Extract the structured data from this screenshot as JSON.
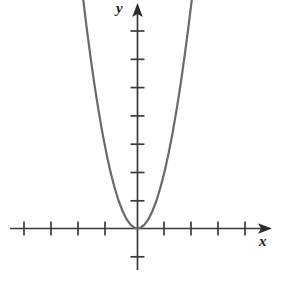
{
  "figure": {
    "width": 294,
    "height": 304,
    "background": "#ffffff"
  },
  "labels": {
    "x_axis": "x",
    "y_axis": "y"
  },
  "chart_data": {
    "type": "line",
    "title": "",
    "subtitle": "",
    "xlabel": "x",
    "ylabel": "y",
    "grid": false,
    "legend": null,
    "annotations": [],
    "axes": {
      "origin_px": [
        137.5,
        228.5
      ],
      "x_axis": {
        "start_px": 10,
        "end_px": 272,
        "arrow": "right",
        "tick_spacing_px": 27,
        "tick_positions_px": [
          24,
          51,
          78,
          105,
          137.5,
          164,
          191,
          218,
          245
        ],
        "tick_values": [
          -4,
          -3,
          -2,
          -1,
          0,
          1,
          2,
          3,
          4
        ],
        "tick_labels_shown": false,
        "range": [
          -4.7,
          5
        ]
      },
      "y_axis": {
        "start_px": 270,
        "end_px": 3,
        "arrow": "up",
        "tick_spacing_px": 28.3,
        "tick_positions_px": [
          31,
          59.3,
          87.6,
          115.9,
          144.2,
          172.5,
          200.8,
          228.5,
          256.8
        ],
        "tick_values": [
          7,
          6,
          5,
          4,
          3,
          2,
          1,
          0,
          -1
        ],
        "tick_labels_shown": false,
        "range": [
          -1,
          8
        ]
      }
    },
    "series": [
      {
        "name": "parabola",
        "equation": "y = 2x^2",
        "coefficient_a": 2,
        "vertex": [
          0,
          0
        ],
        "opens": "up",
        "color": "#6a6a6a",
        "line_width": 2.2,
        "x": [
          -2.05,
          -1.9,
          -1.75,
          -1.6,
          -1.45,
          -1.3,
          -1.15,
          -1.0,
          -0.85,
          -0.7,
          -0.55,
          -0.4,
          -0.25,
          -0.1,
          0,
          0.1,
          0.25,
          0.4,
          0.55,
          0.7,
          0.85,
          1.0,
          1.15,
          1.3,
          1.45,
          1.6,
          1.75,
          1.9,
          2.05
        ],
        "y": [
          8.4,
          7.22,
          6.13,
          5.12,
          4.21,
          3.38,
          2.65,
          2.0,
          1.45,
          0.98,
          0.61,
          0.32,
          0.13,
          0.02,
          0,
          0.02,
          0.13,
          0.32,
          0.61,
          0.98,
          1.45,
          2.0,
          2.65,
          3.38,
          4.21,
          5.12,
          6.13,
          7.22,
          8.4
        ]
      }
    ]
  },
  "style": {
    "axis_color": "#3a3a3a",
    "tick_color": "#3a3a3a",
    "curve_color": "#6a6a6a",
    "label_color": "#1d1d1d",
    "background": "#ffffff"
  }
}
